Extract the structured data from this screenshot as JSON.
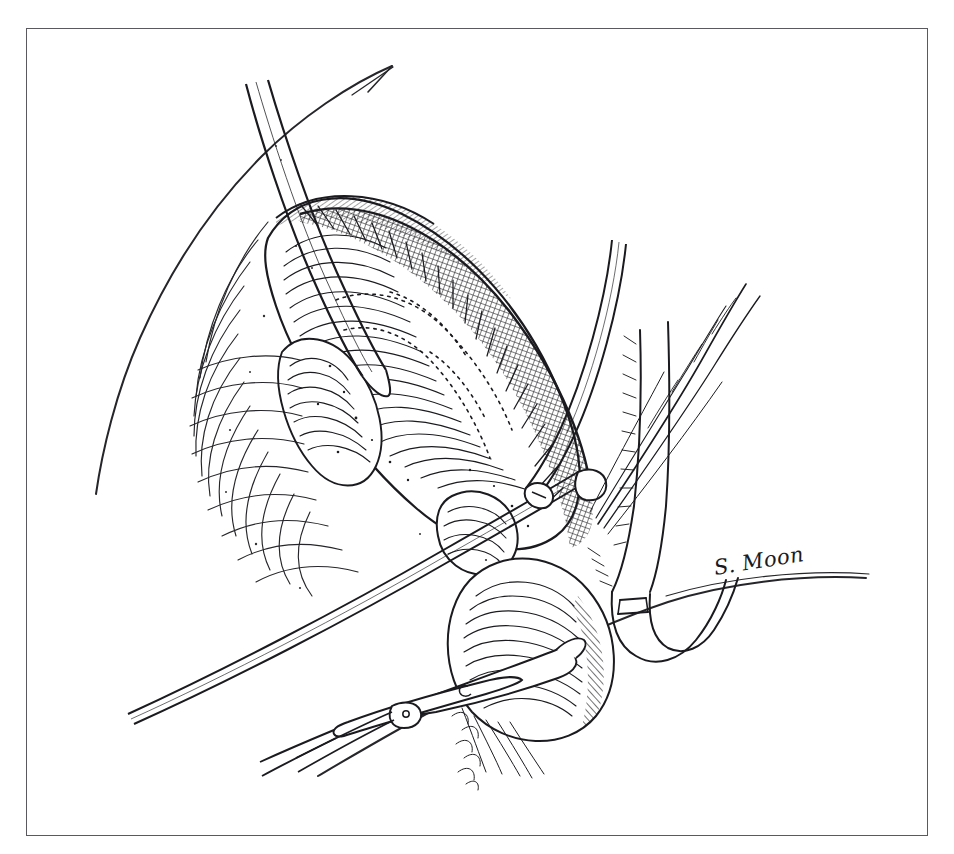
{
  "plate": {
    "medium": "pen-and-ink line drawing",
    "subject": "surgical dissection illustration",
    "background_color": "#ffffff",
    "ink_color": "#1b1b1f",
    "frame": {
      "name": "rectangular-plate-border",
      "color": "#5a5a5e",
      "stroke_width": 1.6,
      "x": 26,
      "y": 28,
      "width": 902,
      "height": 808
    }
  },
  "signature": {
    "text": "S. Moon",
    "x": 716,
    "y": 556,
    "rotation_deg": -9,
    "color": "#1b1b1f"
  },
  "elements": [
    {
      "name": "body-contour-left",
      "label": "skin contour line"
    },
    {
      "name": "retractor-instrument-upper",
      "label": "retractor shaft upper-left"
    },
    {
      "name": "dissected-tissue-mass",
      "label": "hatched tissue mass"
    },
    {
      "name": "stippled-dissection-plane",
      "label": "dotted surgical plane outline"
    },
    {
      "name": "vascular-branches-right",
      "label": "vessel branches right"
    },
    {
      "name": "vessel-loop-lower-right",
      "label": "looped vessel lower right"
    },
    {
      "name": "scissors-instrument-lower",
      "label": "dissecting scissors lower"
    },
    {
      "name": "forceps-instrument-left",
      "label": "long forceps from left"
    },
    {
      "name": "clip-marker-center",
      "label": "surgical clip center"
    }
  ]
}
